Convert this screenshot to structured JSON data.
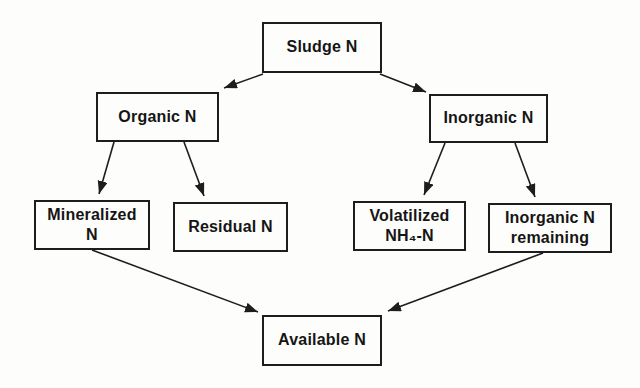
{
  "diagram": {
    "type": "flowchart",
    "background_color": "#fdfdfb",
    "line_color": "#1d1d1d",
    "text_color": "#151515",
    "nodes": [
      {
        "id": "sludge-n",
        "label": "Sludge N"
      },
      {
        "id": "organic-n",
        "label": "Organic N"
      },
      {
        "id": "inorganic-n",
        "label": "Inorganic N"
      },
      {
        "id": "mineralized-n",
        "label": "Mineralized\nN"
      },
      {
        "id": "residual-n",
        "label": "Residual N"
      },
      {
        "id": "volatilized-nh4-n",
        "label": "Volatilized\nNH₄-N"
      },
      {
        "id": "inorganic-n-remaining",
        "label": "Inorganic N\nremaining"
      },
      {
        "id": "available-n",
        "label": "Available N"
      }
    ],
    "edges": [
      {
        "from": "sludge-n",
        "to": "organic-n"
      },
      {
        "from": "sludge-n",
        "to": "inorganic-n"
      },
      {
        "from": "organic-n",
        "to": "mineralized-n"
      },
      {
        "from": "organic-n",
        "to": "residual-n"
      },
      {
        "from": "inorganic-n",
        "to": "volatilized-nh4-n"
      },
      {
        "from": "inorganic-n",
        "to": "inorganic-n-remaining"
      },
      {
        "from": "mineralized-n",
        "to": "available-n"
      },
      {
        "from": "inorganic-n-remaining",
        "to": "available-n"
      }
    ]
  }
}
